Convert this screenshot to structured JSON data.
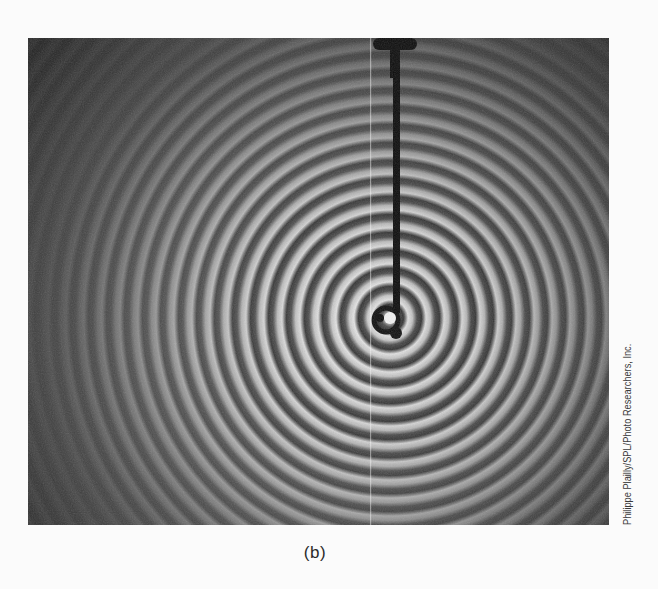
{
  "figure": {
    "caption_label": "(b)",
    "photo_credit": "Philippe Plailly/SPL/Photo Researchers, Inc.",
    "photo": {
      "subject": "concentric circular water ripples spreading from a vertical rod dipping into a surface",
      "palette": {
        "background_dark": "#2b2b2b",
        "background_mid": "#5a5a5a",
        "ripple_light": "#e6e6e6",
        "ripple_dark": "#151515",
        "rod": "#0e0e0e"
      },
      "ripple_center": {
        "x": 362,
        "y": 280
      },
      "ring_spacing_px": 18
    }
  }
}
